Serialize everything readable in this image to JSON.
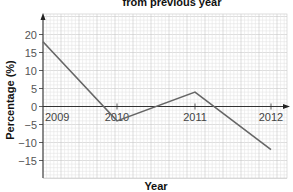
{
  "chart_data": {
    "type": "line",
    "title": "from previous year",
    "xlabel": "Year",
    "ylabel": "Percentage (%)",
    "categories": [
      "2009",
      "2010",
      "2011",
      "2012"
    ],
    "x": [
      2009,
      2010,
      2011,
      2012
    ],
    "values": [
      18,
      -4,
      4,
      -12
    ],
    "series": [
      {
        "name": "Percentage change from previous year",
        "values": [
          18,
          -4,
          4,
          -12
        ],
        "color": "#666666"
      }
    ],
    "ylim": [
      -20,
      25
    ],
    "yticks": [
      20,
      15,
      10,
      5,
      0,
      -5,
      -10,
      -15
    ],
    "ytick_labels": [
      "20",
      "15",
      "10",
      "5",
      "0",
      "−5",
      "−10",
      "−15"
    ],
    "grid": true,
    "grid_style": "graph paper: minor lines every 1 unit, major every 5 units",
    "legend": null
  },
  "colors": {
    "line": "#666666",
    "axis": "#333333",
    "grid_minor": "#e4e4e4",
    "grid_major": "#c8c8c8"
  }
}
